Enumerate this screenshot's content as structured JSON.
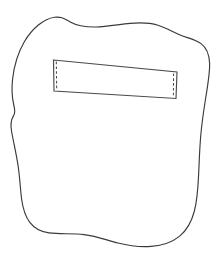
{
  "figure": {
    "background_color": "#ffffff",
    "width": 224,
    "height": 260
  },
  "shapes": {
    "blob": {
      "name": "blob-outline",
      "description": "Hand-drawn irregular closed contour resembling a rounded square with a wavy top edge, a shallow notch on the left side, and an S-curved bottom edge",
      "stroke_color": "#3a3a3a",
      "fill_color": "#ffffff",
      "stroke_width": 1.15,
      "path": "M 54.5 17.2 C 44.0 18.6 32.0 28.5 24.2 42.0 C 17.6 53.4 14.0 66.5 12.6 79.0 C 11.6 88.0 11.9 96.5 13.6 104.0 C 15.0 110.2 15.4 112.8 13.2 116.4 C 10.9 120.2 10.4 124.8 11.6 131.5 C 13.4 141.8 16.4 154.0 18.2 166.5 C 20.0 179.0 20.4 190.0 21.6 199.0 C 22.9 208.6 25.4 216.6 29.8 222.4 C 34.2 228.2 40.6 231.8 49.0 232.9 C 60.0 234.3 72.0 233.2 84.0 234.6 C 96.0 236.0 107.0 240.2 118.0 243.0 C 129.0 245.8 140.0 247.2 151.0 246.4 C 162.0 245.6 172.0 242.4 179.4 236.4 C 186.8 230.4 191.6 221.6 194.4 211.0 C 197.2 200.4 198.0 188.0 198.6 175.0 C 199.2 162.0 199.6 148.4 200.8 135.0 C 202.0 121.6 204.0 108.4 206.0 96.0 C 208.0 83.6 210.0 72.0 209.6 63.0 C 209.2 54.0 206.4 47.6 201.0 43.6 C 195.6 39.6 187.6 38.0 180.2 35.0 C 172.8 32.0 166.0 27.6 158.0 25.2 C 150.0 22.8 140.8 22.4 130.0 23.4 C 119.2 24.4 106.8 26.8 96.0 27.0 C 85.2 27.2 76.0 25.2 70.2 22.0 C 64.4 18.8 61.8 16.4 54.5 17.2 Z"
    },
    "panel": {
      "name": "inner-rectangle-panel",
      "description": "Slightly tilted quadrilateral panel positioned in the upper portion of the blob",
      "stroke_color": "#4a4a4a",
      "fill_color": "#ffffff",
      "stroke_width": 1.15,
      "corners": {
        "top_left": [
          53.5,
          60.0
        ],
        "top_right": [
          177.0,
          72.0
        ],
        "bottom_right": [
          176.0,
          98.5
        ],
        "bottom_left": [
          54.0,
          91.0
        ]
      },
      "path": "M 53.5 60.0 L 177.0 72.0 L 176.0 98.5 L 54.0 91.0 Z"
    },
    "panel_dashes": {
      "name": "panel-dashed-edges",
      "description": "Short vertical dashed lines set just inside the left and right edges of the panel",
      "stroke_color": "#4a4a4a",
      "dash_pattern": "2.6 2.2",
      "left_path": "M 56.3 61.6 L 56.7 89.6",
      "right_path": "M 173.6 73.5 L 173.4 96.9"
    }
  }
}
